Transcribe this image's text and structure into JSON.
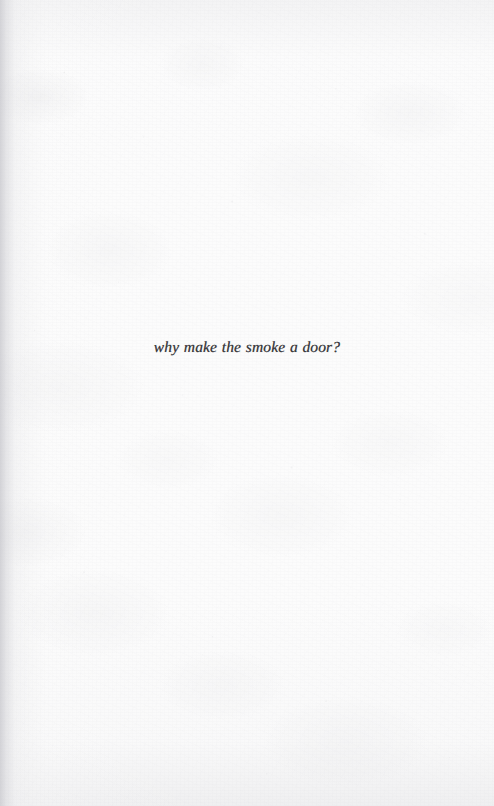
{
  "page": {
    "kind": "scanned-book-page",
    "width": 494,
    "height": 806,
    "paper_color": "#fbfbfb",
    "ink_color": "#2b2b2f",
    "gutter_edge": "left",
    "page_number": "",
    "header": "",
    "footer": ""
  },
  "body": {
    "lines": [
      {
        "text": "why make the smoke a door?",
        "style": "italic",
        "align": "center"
      }
    ]
  }
}
